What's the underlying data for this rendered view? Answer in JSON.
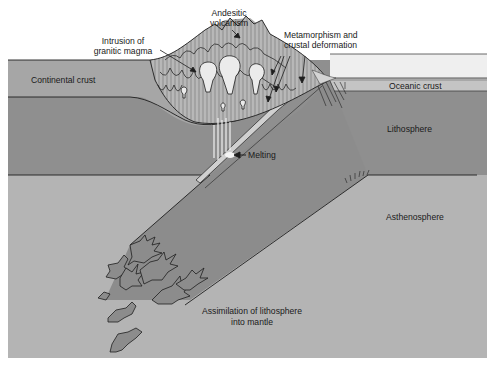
{
  "diagram": {
    "type": "geologic cross-section",
    "colors": {
      "background": "#ffffff",
      "continental_crust": "#a6a6a6",
      "lithosphere": "#8f8f8f",
      "asthenosphere": "#b4b4b4",
      "slab": "#8c8c8c",
      "oceanic_crust": "#c4c4c4",
      "sea": "#efefef",
      "mountain": "#9a9a9a",
      "intrusions": "#ebebeb",
      "lines": "#1e1e1e"
    }
  },
  "labels": {
    "andesitic_volcanism": [
      "Andesitic",
      "volcanism"
    ],
    "intrusion": [
      "Intrusion of",
      "granitic magma"
    ],
    "metamorphism": [
      "Metamorphism and",
      "crustal deformation"
    ],
    "continental_crust": "Continental crust",
    "oceanic_crust": "Oceanic crust",
    "lithosphere": "Lithosphere",
    "melting": "Melting",
    "asthenosphere": "Asthenosphere",
    "assimilation": [
      "Assimilation of lithosphere",
      "into mantle"
    ]
  }
}
